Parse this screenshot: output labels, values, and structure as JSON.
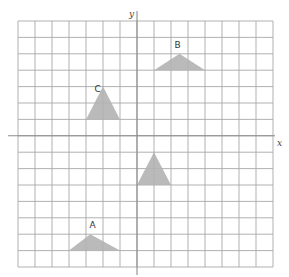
{
  "grid": {
    "left": 18,
    "top": 21,
    "cell_w": 17,
    "cell_h": 16.4,
    "cols": 15,
    "rows": 15,
    "origin_col": 7,
    "origin_row": 7,
    "line_color": "#a8a8a8",
    "axis_color": "#8c8c8c"
  },
  "axes": {
    "x_label": "x",
    "y_label": "y"
  },
  "shapes": [
    {
      "label": "A",
      "points": [
        [
          -4,
          -7
        ],
        [
          -1,
          -7
        ],
        [
          -2.75,
          -6
        ]
      ],
      "label_pos": [
        -2.8,
        -5.6
      ]
    },
    {
      "label": "B",
      "points": [
        [
          1,
          4
        ],
        [
          4,
          4
        ],
        [
          2.5,
          5
        ]
      ],
      "label_pos": [
        2.2,
        5.35
      ]
    },
    {
      "label": "C",
      "points": [
        [
          -3,
          1
        ],
        [
          -1,
          1
        ],
        [
          -2,
          3
        ]
      ],
      "label_pos": [
        -2.5,
        2.65
      ]
    },
    {
      "label": "",
      "points": [
        [
          0,
          -3
        ],
        [
          2,
          -3
        ],
        [
          1,
          -1
        ]
      ],
      "label_pos": null
    }
  ],
  "fill_color": "#b3b3b3"
}
